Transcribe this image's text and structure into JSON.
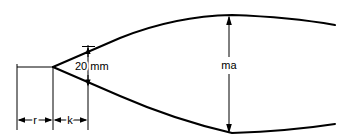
{
  "figure": {
    "type": "engineering-dimension-diagram",
    "background_color": "#ffffff",
    "line_color": "#000000",
    "width": 342,
    "height": 140
  },
  "labels": {
    "gap_dimension": "20 mm",
    "height_dimension": "ma",
    "left_segment": "r",
    "right_segment": "k"
  },
  "geometry": {
    "vertex": {
      "x": 53,
      "y": 67
    },
    "centerline": {
      "x1": 17,
      "y1": 67,
      "x2": 53,
      "y2": 67
    },
    "top_curve": "M 53 67 L 120 38 Q 175 16 232 15 Q 290 17 335 25",
    "bottom_curve": "M 53 67 L 120 96 Q 175 120 232 133 Q 290 131 335 124",
    "extension_lines": [
      {
        "x": 17,
        "y1": 67,
        "y2": 130
      },
      {
        "x": 53,
        "y1": 67,
        "y2": 130
      },
      {
        "x": 88,
        "y1": 47,
        "y2": 130
      }
    ],
    "bottom_dim_line_y": 120,
    "gap_arrow_x": 88,
    "gap_arrow_top_y": 47,
    "gap_arrow_bottom_y": 86,
    "height_arrow_x": 229,
    "height_arrow_top_y": 16,
    "height_arrow_bottom_y": 133
  },
  "text_positions": {
    "gap_dimension": {
      "x": 75,
      "y": 70
    },
    "height_dimension": {
      "x": 229,
      "y": 69
    },
    "left_segment": {
      "x": 35,
      "y": 124
    },
    "right_segment": {
      "x": 70,
      "y": 124
    }
  }
}
